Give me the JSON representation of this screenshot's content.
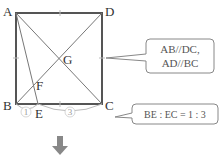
{
  "points": {
    "A": "A",
    "B": "B",
    "C": "C",
    "D": "D",
    "E": "E",
    "F": "F",
    "G": "G"
  },
  "ratio_marks": {
    "be": "1",
    "ec": "3"
  },
  "callouts": {
    "parallel_line1": "AB//DC,",
    "parallel_line2": "AD//BC",
    "ratio": "BE : EC = 1 : 3"
  },
  "colors": {
    "square": "#555555",
    "lines": "#777777",
    "callout_border": "#888888",
    "arrow": "#888888"
  }
}
